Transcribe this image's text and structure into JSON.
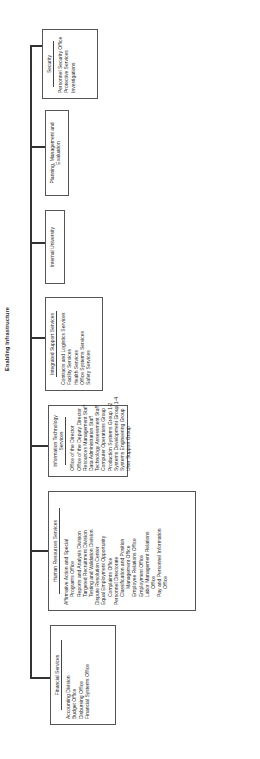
{
  "chart": {
    "title": "Enabling Infrastructure",
    "units": [
      {
        "name": "Financial Services",
        "items": [
          {
            "text": "Accounting Division",
            "indent": false
          },
          {
            "text": "Budget Office",
            "indent": false
          },
          {
            "text": "Disbursing Office",
            "indent": false
          },
          {
            "text": "Financial Systems Office",
            "indent": false
          }
        ]
      },
      {
        "name": "Human Resources Services",
        "items": [
          {
            "text": "Affirmative Action and Special",
            "indent": false
          },
          {
            "text": "Programs Office",
            "indent": true
          },
          {
            "text": "Reports and Analysis Division",
            "indent": true
          },
          {
            "text": "Targeted Recruitment Division",
            "indent": true
          },
          {
            "text": "Testing and Validation Division",
            "indent": true
          },
          {
            "text": "Dispute Resolution Center",
            "indent": false
          },
          {
            "text": "Equal Employment Opportunity",
            "indent": false
          },
          {
            "text": "Complaints Office",
            "indent": true
          },
          {
            "text": "Personnel Directorate",
            "indent": false
          },
          {
            "text": "Classification and Position",
            "indent": true
          },
          {
            "text": "Management Office",
            "indent": true
          },
          {
            "text": "Employee Relations Office",
            "indent": true
          },
          {
            "text": "Employment Office",
            "indent": true
          },
          {
            "text": "Labor Management Relations",
            "indent": true
          },
          {
            "text": "Office",
            "indent": true
          },
          {
            "text": "Pay and Personnel Information",
            "indent": true
          },
          {
            "text": "Office",
            "indent": true
          }
        ]
      },
      {
        "name": "Information Technology Services",
        "items": [
          {
            "text": "Office of the Director",
            "indent": false
          },
          {
            "text": "Office of the Deputy Director",
            "indent": false
          },
          {
            "text": "Resources Management Staff",
            "indent": false
          },
          {
            "text": "Data Administration Staff",
            "indent": false
          },
          {
            "text": "Technology Assessment Staff",
            "indent": false
          },
          {
            "text": "Computer Operations Group",
            "indent": false
          },
          {
            "text": "Production Systems Group 1-2",
            "indent": false
          },
          {
            "text": "Systems Development Group 1-4",
            "indent": false
          },
          {
            "text": "Systems Engineering Group",
            "indent": false
          },
          {
            "text": "User Support Group",
            "indent": false
          }
        ]
      },
      {
        "name": "Integrated Support Services",
        "items": [
          {
            "text": "Contracts and Logistics Services",
            "indent": false
          },
          {
            "text": "Facility Services",
            "indent": false
          },
          {
            "text": "Health Services",
            "indent": false
          },
          {
            "text": "Office Systems Services",
            "indent": false
          },
          {
            "text": "Safety Services",
            "indent": false
          }
        ]
      },
      {
        "name": "Internal University",
        "items": []
      },
      {
        "name": "Planning, Management and Evaluation",
        "items": []
      },
      {
        "name": "Security",
        "items": [
          {
            "text": "Personnel Security Office",
            "indent": false
          },
          {
            "text": "Protective Services",
            "indent": false
          },
          {
            "text": "Investigations",
            "indent": false
          }
        ]
      }
    ]
  }
}
